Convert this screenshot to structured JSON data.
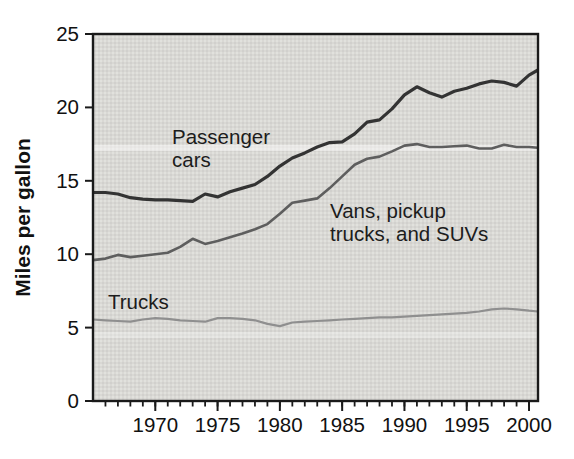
{
  "chart_data": {
    "type": "line",
    "title": "",
    "xlabel": "",
    "ylabel": "Miles per gallon",
    "grid": false,
    "legend_position": "inline-annotations",
    "plot_background_color": "#d9d8d4",
    "axis_color": "#1a1a1a",
    "text_color": "#111111",
    "y_axis": {
      "range": [
        0,
        25
      ],
      "ticks": [
        0,
        5,
        10,
        15,
        20,
        25
      ],
      "tick_labels": [
        "0",
        "5",
        "10",
        "15",
        "20",
        "25"
      ]
    },
    "x_axis": {
      "range": [
        1965,
        2000.72
      ],
      "major_ticks": [
        1970,
        1975,
        1980,
        1985,
        1990,
        1995,
        2000
      ],
      "major_tick_labels": [
        "1970",
        "1975",
        "1980",
        "1985",
        "1990",
        "1995",
        "2000"
      ],
      "minor_tick_start": 1966,
      "minor_tick_end": 2000,
      "minor_tick_step": 1
    },
    "years": [
      1965,
      1966,
      1967,
      1968,
      1969,
      1970,
      1971,
      1972,
      1973,
      1974,
      1975,
      1976,
      1977,
      1978,
      1979,
      1980,
      1981,
      1982,
      1983,
      1984,
      1985,
      1986,
      1987,
      1988,
      1989,
      1990,
      1991,
      1992,
      1993,
      1994,
      1995,
      1996,
      1997,
      1998,
      1999,
      2000
    ],
    "series": [
      {
        "name": "Passenger cars",
        "color": "#333333",
        "line_width": 3.2,
        "values": [
          14.2,
          14.2,
          14.1,
          13.85,
          13.75,
          13.7,
          13.7,
          13.65,
          13.6,
          14.1,
          13.9,
          14.25,
          14.5,
          14.75,
          15.3,
          16.0,
          16.55,
          16.9,
          17.3,
          17.6,
          17.65,
          18.2,
          19.0,
          19.15,
          19.9,
          20.85,
          21.4,
          21.0,
          20.7,
          21.1,
          21.3,
          21.6,
          21.8,
          21.7,
          21.45,
          22.2
        ],
        "edge_value": 22.55
      },
      {
        "name": "Vans, pickup trucks, and SUVs",
        "color": "#5e5e5e",
        "line_width": 2.6,
        "values": [
          9.6,
          9.7,
          9.95,
          9.8,
          9.9,
          10.0,
          10.1,
          10.5,
          11.05,
          10.7,
          10.9,
          11.15,
          11.4,
          11.7,
          12.05,
          12.75,
          13.5,
          13.65,
          13.8,
          14.5,
          15.3,
          16.1,
          16.5,
          16.65,
          17.0,
          17.4,
          17.5,
          17.3,
          17.3,
          17.35,
          17.4,
          17.2,
          17.2,
          17.45,
          17.3,
          17.3
        ],
        "edge_value": 17.25
      },
      {
        "name": "Trucks",
        "color": "#8f8f8f",
        "line_width": 2.2,
        "values": [
          5.55,
          5.5,
          5.45,
          5.4,
          5.55,
          5.65,
          5.6,
          5.5,
          5.45,
          5.4,
          5.65,
          5.65,
          5.6,
          5.5,
          5.25,
          5.1,
          5.35,
          5.4,
          5.45,
          5.5,
          5.55,
          5.6,
          5.65,
          5.7,
          5.7,
          5.75,
          5.8,
          5.85,
          5.9,
          5.95,
          6.0,
          6.1,
          6.25,
          6.3,
          6.25,
          6.15
        ],
        "edge_value": 6.1
      }
    ],
    "annotations": [
      {
        "name": "passenger-cars-label",
        "lines": [
          "Passenger",
          "cars"
        ],
        "x": 172,
        "y": 144
      },
      {
        "name": "vans-pickup-suvs-label",
        "lines": [
          "Vans, pickup",
          "trucks, and SUVs"
        ],
        "x": 330,
        "y": 218
      },
      {
        "name": "trucks-label",
        "lines": [
          "Trucks"
        ],
        "x": 108,
        "y": 309
      }
    ]
  }
}
